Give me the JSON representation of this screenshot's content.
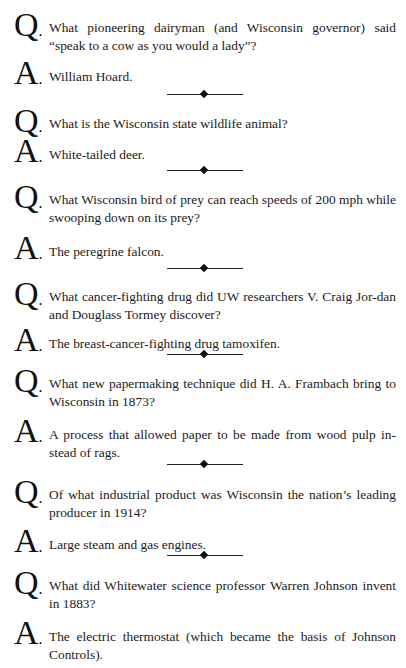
{
  "labels": {
    "question": "Q",
    "answer": "A",
    "dot": "."
  },
  "items": [
    {
      "q": "What pioneering dairyman (and Wisconsin governor) said “speak to a cow as you would a lady”?",
      "a": "William Hoard."
    },
    {
      "q": "What is the Wisconsin state wildlife animal?",
      "a": "White-tailed deer."
    },
    {
      "q": "What Wisconsin bird of prey can reach speeds of 200 mph while swooping down on its prey?",
      "a": "The peregrine falcon."
    },
    {
      "q": "What cancer-fighting drug did UW researchers V. Craig Jor-dan and Douglass Tormey discover?",
      "a": "The breast-cancer-fighting drug tamoxifen."
    },
    {
      "q": "What new papermaking technique did H. A. Frambach bring to Wisconsin in 1873?",
      "a": "A process that allowed paper to be made from wood pulp in-stead of rags."
    },
    {
      "q": "Of what industrial product was Wisconsin the nation’s leading producer in 1914?",
      "a": "Large steam and gas engines."
    },
    {
      "q": "What did Whitewater science professor Warren Johnson invent in 1883?",
      "a": "The electric thermostat (which became the basis of Johnson Controls)."
    }
  ]
}
